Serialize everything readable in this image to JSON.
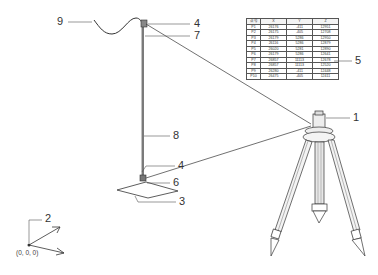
{
  "callouts": {
    "c1": "1",
    "c2": "2",
    "c3": "3",
    "c4_top": "4",
    "c4_bottom": "4",
    "c5": "5",
    "c6": "6",
    "c7": "7",
    "c8": "8",
    "c9": "9"
  },
  "origin_label": "(0, 0, 0)",
  "coordinate_table": {
    "headers": [
      "点号",
      "X",
      "Y",
      "Z"
    ],
    "rows": [
      [
        "P1",
        "26176",
        "-411",
        "12951"
      ],
      [
        "P2",
        "26175",
        "-405",
        "12708"
      ],
      [
        "P3",
        "26179",
        "5286",
        "12950"
      ],
      [
        "P4",
        "26116",
        "5286",
        "12879"
      ],
      [
        "P5",
        "26020",
        "5281",
        "12890"
      ],
      [
        "P6",
        "26179",
        "5286",
        "12641"
      ],
      [
        "P7",
        "26857",
        "11113",
        "12678"
      ],
      [
        "P8",
        "26857",
        "11113",
        "12520"
      ],
      [
        "P9",
        "26280",
        "-411",
        "12448"
      ],
      [
        "P10",
        "26475",
        "-405",
        "12411"
      ]
    ]
  },
  "colors": {
    "line": "#333333",
    "background": "#ffffff"
  }
}
